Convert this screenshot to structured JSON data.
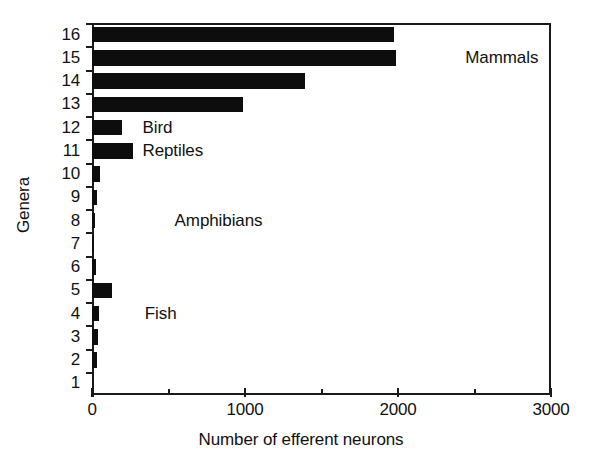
{
  "chart_data": {
    "type": "bar",
    "orientation": "horizontal",
    "title": "",
    "xlabel": "Number of efferent neurons",
    "ylabel": "Genera",
    "xlim": [
      0,
      3000
    ],
    "grid": false,
    "legend": "none",
    "x_ticks_major": [
      "0",
      "1000",
      "2000",
      "3000"
    ],
    "x_ticks_major_values": [
      0,
      1000,
      2000,
      3000
    ],
    "x_ticks_minor_values": [
      500,
      1500,
      2500
    ],
    "categories": [
      "1",
      "2",
      "3",
      "4",
      "5",
      "6",
      "7",
      "8",
      "9",
      "10",
      "11",
      "12",
      "13",
      "14",
      "15",
      "16"
    ],
    "values": [
      0,
      32,
      38,
      45,
      130,
      25,
      5,
      20,
      30,
      50,
      270,
      195,
      990,
      1390,
      1985,
      1975
    ],
    "bar_color": "#0d0d0d",
    "annotations": [
      {
        "text": "Mammals",
        "x_value": 2440,
        "category": "15"
      },
      {
        "text": "Bird",
        "x_value": 330,
        "category": "12"
      },
      {
        "text": "Reptiles",
        "x_value": 330,
        "category": "11"
      },
      {
        "text": "Amphibians",
        "x_value": 540,
        "category": "8"
      },
      {
        "text": "Fish",
        "x_value": 345,
        "category": "4"
      }
    ]
  },
  "axes": {
    "y_labels": [
      "16",
      "15",
      "14",
      "13",
      "12",
      "11",
      "10",
      "9",
      "8",
      "7",
      "6",
      "5",
      "4",
      "3",
      "2",
      "1"
    ],
    "y_title": "Genera",
    "x_title": "Number of efferent neurons",
    "x_labels": [
      "0",
      "1000",
      "2000",
      "3000"
    ]
  }
}
